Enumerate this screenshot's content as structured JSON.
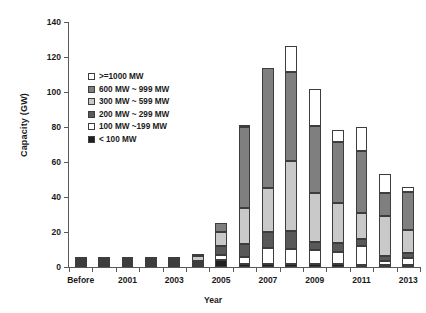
{
  "chart_data": {
    "type": "bar",
    "stacked": true,
    "title": "",
    "xlabel": "Year",
    "ylabel": "Capacity (GW)",
    "ylim": [
      0,
      140
    ],
    "ytick_step": 20,
    "yticks": [
      0,
      20,
      40,
      60,
      80,
      100,
      120,
      140
    ],
    "grid": false,
    "legend_position": "upper-left-inside",
    "categories": [
      "Before",
      "2000",
      "2001",
      "2002",
      "2003",
      "2004",
      "2005",
      "2006",
      "2007",
      "2008",
      "2009",
      "2010",
      "2011",
      "2012",
      "2013"
    ],
    "xtick_labels": [
      "Before",
      "",
      "2001",
      "",
      "2003",
      "",
      "2005",
      "",
      "2007",
      "",
      "2009",
      "",
      "2011",
      "",
      "2013"
    ],
    "series": [
      {
        "name": "< 100 MW",
        "color": "#231f20",
        "values": [
          1.2,
          0.4,
          0.3,
          0.3,
          0.6,
          0.8,
          4.0,
          2.0,
          2.0,
          1.5,
          1.5,
          1.5,
          1.0,
          1.0,
          0.8
        ]
      },
      {
        "name": "100 MW ~199 MW",
        "color": "#ffffff",
        "values": [
          1.0,
          0.3,
          0.2,
          0.2,
          1.0,
          1.0,
          3.0,
          4.0,
          9.0,
          9.0,
          8.0,
          7.0,
          11.0,
          2.5,
          4.0
        ]
      },
      {
        "name": "200 MW ~ 299 MW",
        "color": "#595959",
        "values": [
          0.8,
          0.3,
          0.2,
          0.3,
          0.8,
          1.2,
          5.0,
          7.0,
          9.0,
          10.0,
          5.0,
          5.0,
          4.0,
          2.5,
          3.0
        ]
      },
      {
        "name": "300 MW ~ 599 MW",
        "color": "#c9c9c9",
        "values": [
          1.5,
          0.4,
          0.3,
          0.4,
          2.0,
          3.0,
          8.0,
          21.0,
          25.0,
          40.0,
          28.0,
          23.0,
          15.0,
          23.0,
          13.0
        ]
      },
      {
        "name": "600 MW ~ 999 MW",
        "color": "#7f7f7f",
        "values": [
          0.5,
          0.3,
          0.2,
          0.2,
          0.8,
          1.2,
          5.0,
          46.0,
          69.0,
          51.0,
          38.0,
          35.0,
          35.0,
          13.0,
          22.0
        ]
      },
      {
        "name": ">=1000 MW",
        "color": "#ffffff",
        "values": [
          0.0,
          0.0,
          0.0,
          0.0,
          0.0,
          0.0,
          0.0,
          1.0,
          0.0,
          15.0,
          21.0,
          7.0,
          14.0,
          11.0,
          3.0
        ]
      }
    ],
    "totals": [
      5.0,
      1.7,
      1.2,
      1.4,
      5.2,
      7.2,
      25.0,
      81.0,
      114.0,
      126.5,
      101.5,
      78.5,
      80.0,
      53.0,
      45.8
    ]
  },
  "legend": {
    "items": [
      {
        "label": ">=1000 MW",
        "color": "#ffffff"
      },
      {
        "label": "600 MW ~ 999 MW",
        "color": "#7f7f7f"
      },
      {
        "label": "300 MW ~ 599 MW",
        "color": "#c9c9c9"
      },
      {
        "label": "200 MW ~ 299 MW",
        "color": "#595959"
      },
      {
        "label": "100 MW ~199 MW",
        "color": "#ffffff"
      },
      {
        "label": "< 100 MW",
        "color": "#231f20"
      }
    ]
  },
  "axis": {
    "y_title": "Capacity (GW)",
    "x_title": "Year"
  }
}
